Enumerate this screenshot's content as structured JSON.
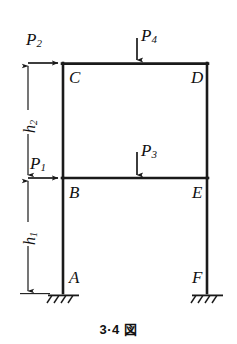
{
  "figure": {
    "caption": "3·4 図",
    "type": "structural-frame-diagram",
    "stroke_color": "#1a1a1a",
    "background_color": "#ffffff"
  },
  "nodes": [
    {
      "id": "A",
      "label": "A",
      "role": "fixed-support",
      "x": 63,
      "y": 293
    },
    {
      "id": "B",
      "label": "B",
      "role": "joint",
      "x": 63,
      "y": 178
    },
    {
      "id": "C",
      "label": "C",
      "role": "joint",
      "x": 63,
      "y": 63
    },
    {
      "id": "D",
      "label": "D",
      "role": "joint",
      "x": 207,
      "y": 63
    },
    {
      "id": "E",
      "label": "E",
      "role": "joint",
      "x": 207,
      "y": 178
    },
    {
      "id": "F",
      "label": "F",
      "role": "fixed-support",
      "x": 207,
      "y": 293
    }
  ],
  "members": [
    {
      "id": "AB",
      "from": "A",
      "to": "B",
      "kind": "column"
    },
    {
      "id": "BC",
      "from": "B",
      "to": "C",
      "kind": "column"
    },
    {
      "id": "CD",
      "from": "C",
      "to": "D",
      "kind": "beam"
    },
    {
      "id": "BE",
      "from": "B",
      "to": "E",
      "kind": "beam"
    },
    {
      "id": "EF",
      "from": "E",
      "to": "F",
      "kind": "column"
    },
    {
      "id": "DE",
      "from": "D",
      "to": "E",
      "kind": "column"
    }
  ],
  "loads": [
    {
      "id": "P1",
      "label": "P",
      "subscript": "1",
      "direction": "horizontal-right",
      "applied_at": "B",
      "tip_x": 63,
      "tip_y": 178
    },
    {
      "id": "P2",
      "label": "P",
      "subscript": "2",
      "direction": "horizontal-right",
      "applied_at": "C",
      "tip_x": 63,
      "tip_y": 63
    },
    {
      "id": "P3",
      "label": "P",
      "subscript": "3",
      "direction": "vertical-down",
      "applied_at": "beam-BE-midspan",
      "tip_x": 137,
      "tip_y": 178
    },
    {
      "id": "P4",
      "label": "P",
      "subscript": "4",
      "direction": "vertical-down",
      "applied_at": "beam-CD-midspan",
      "tip_x": 137,
      "tip_y": 63
    }
  ],
  "dimensions": [
    {
      "id": "h1",
      "label": "h",
      "subscript": "1",
      "from_y": 178,
      "to_y": 293,
      "axis_x": 28,
      "orientation": "vertical",
      "description": "first storey height, B to A"
    },
    {
      "id": "h2",
      "label": "h",
      "subscript": "2",
      "from_y": 63,
      "to_y": 178,
      "axis_x": 28,
      "orientation": "vertical",
      "description": "second storey height, C to B"
    }
  ],
  "supports": [
    {
      "at": "A",
      "type": "fixed",
      "hatch_count": 4
    },
    {
      "at": "F",
      "type": "fixed",
      "hatch_count": 4
    }
  ]
}
